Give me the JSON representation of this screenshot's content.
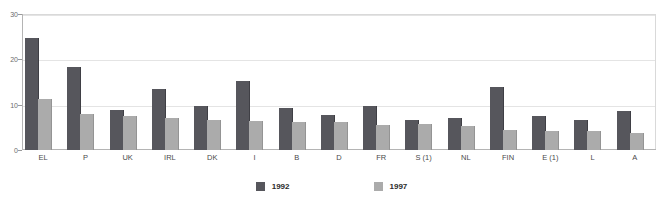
{
  "chart_data": {
    "type": "bar",
    "title": "",
    "subtitle": "",
    "xlabel": "",
    "ylabel": "",
    "ylim": [
      0,
      30
    ],
    "yticks": [
      0,
      10,
      20,
      30
    ],
    "grid": true,
    "legend_position": "bottom-center",
    "categories": [
      "EL",
      "P",
      "UK",
      "IRL",
      "DK",
      "I",
      "B",
      "D",
      "FR",
      "S (1)",
      "NL",
      "FIN",
      "E (1)",
      "L",
      "A"
    ],
    "series": [
      {
        "name": "1992",
        "color": "#56565c",
        "values": [
          24.7,
          18.3,
          8.8,
          13.5,
          9.8,
          15.2,
          9.3,
          7.7,
          9.6,
          6.7,
          7.1,
          13.8,
          7.6,
          6.6,
          8.6
        ]
      },
      {
        "name": "1997",
        "color": "#ababab",
        "values": [
          11.3,
          7.9,
          7.4,
          7.1,
          6.6,
          6.5,
          6.1,
          6.2,
          5.6,
          5.8,
          5.2,
          4.5,
          4.1,
          4.1,
          3.7
        ]
      }
    ]
  },
  "axis": {
    "y_tick_labels": [
      "0",
      "10",
      "20",
      "30"
    ]
  },
  "legend": {
    "entries": [
      {
        "label": "1992",
        "color": "#56565c"
      },
      {
        "label": "1997",
        "color": "#ababab"
      }
    ]
  },
  "colors": {
    "series_1992": "#56565c",
    "series_1997": "#ababab",
    "grid": "#e4e4e4",
    "frame": "#d9d9d9",
    "axis": "#b4b4b4",
    "tick_text": "#6b6b6b",
    "label_text": "#4a4a4a",
    "background": "#ffffff"
  }
}
